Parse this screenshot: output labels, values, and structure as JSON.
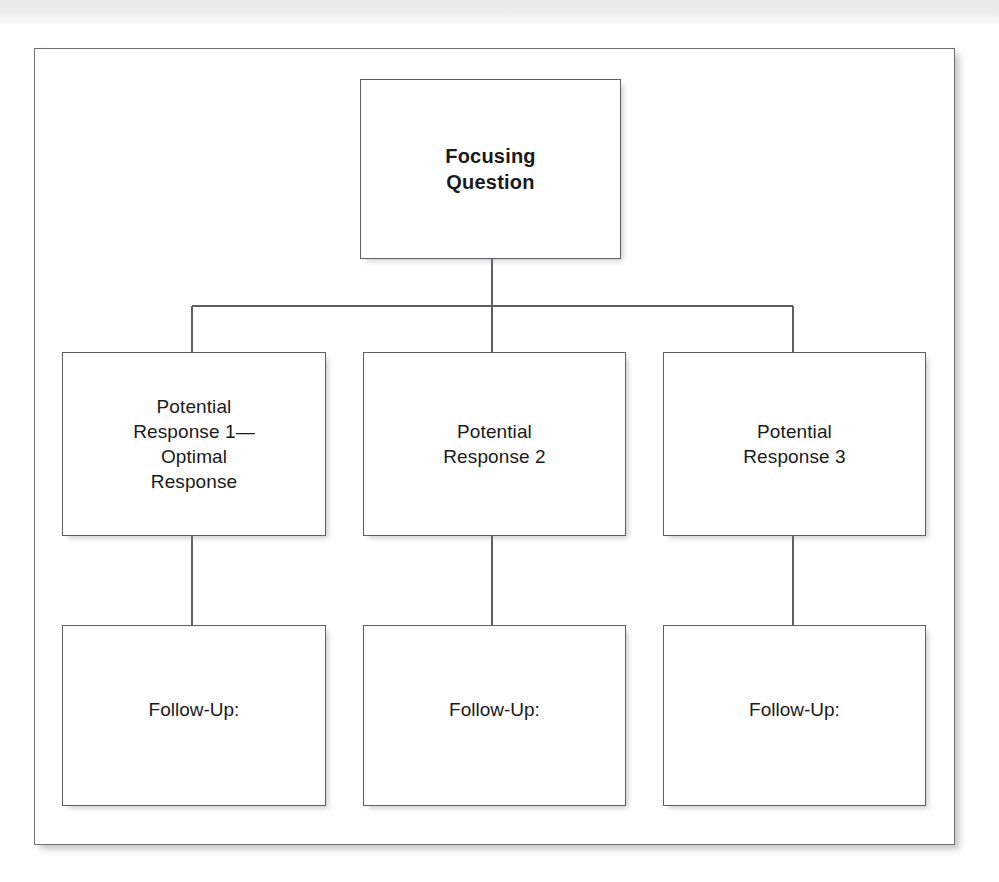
{
  "page": {
    "background_color": "#ffffff",
    "scan_strip_color": "#ededed",
    "cropped_header_text": "••••••••••••••••••••••••••••••"
  },
  "frame": {
    "border_color": "#6e7072",
    "background_color": "#ffffff"
  },
  "diagram": {
    "type": "tree",
    "orientation": "top-down",
    "line_color": "#5d6062",
    "root": {
      "label": "Focusing\nQuestion",
      "bold": true
    },
    "responses": [
      {
        "label": "Potential\nResponse 1—\nOptimal\nResponse"
      },
      {
        "label": "Potential\nResponse 2"
      },
      {
        "label": "Potential\nResponse 3"
      }
    ],
    "followups": [
      {
        "label": "Follow-Up:"
      },
      {
        "label": "Follow-Up:"
      },
      {
        "label": "Follow-Up:"
      }
    ]
  }
}
